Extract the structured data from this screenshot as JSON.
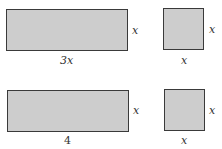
{
  "figures": [
    {
      "shape": "rectangle",
      "width_label": "3x",
      "height_label": "x"
    },
    {
      "shape": "square",
      "width_label": "x",
      "height_label": "x"
    },
    {
      "shape": "rectangle",
      "width_label": "4",
      "height_label": "x"
    },
    {
      "shape": "square",
      "width_label": "x",
      "height_label": "x"
    }
  ],
  "colors": {
    "fill": "#cdcdcd",
    "stroke": "#3a3a3a"
  }
}
